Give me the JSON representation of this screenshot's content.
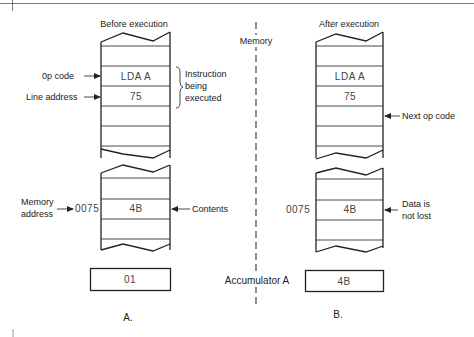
{
  "diagram": {
    "center_label": "Memory",
    "accumulator_label": "Accumulator A",
    "panels": [
      {
        "id": "A",
        "title": "Before execution",
        "caption": "A.",
        "program_cells": [
          "",
          "LDA A",
          "75",
          "",
          ""
        ],
        "data_cells": [
          "",
          "4B",
          ""
        ],
        "data_address": "0075",
        "accumulator_value": "01",
        "annotations": {
          "op_code": "0p code",
          "line_address": "Line address",
          "instruction_brace_lines": [
            "Instruction",
            "being",
            "executed"
          ],
          "memory_address_lines": [
            "Memory",
            "address"
          ],
          "contents": "Contents"
        }
      },
      {
        "id": "B",
        "title": "After execution",
        "caption": "B.",
        "program_cells": [
          "",
          "LDA A",
          "75",
          "",
          ""
        ],
        "data_cells": [
          "",
          "4B",
          ""
        ],
        "data_address": "0075",
        "accumulator_value": "4B",
        "annotations": {
          "next_op_code": "Next op code",
          "data_not_lost_lines": [
            "Data is",
            "not lost"
          ]
        }
      }
    ]
  }
}
